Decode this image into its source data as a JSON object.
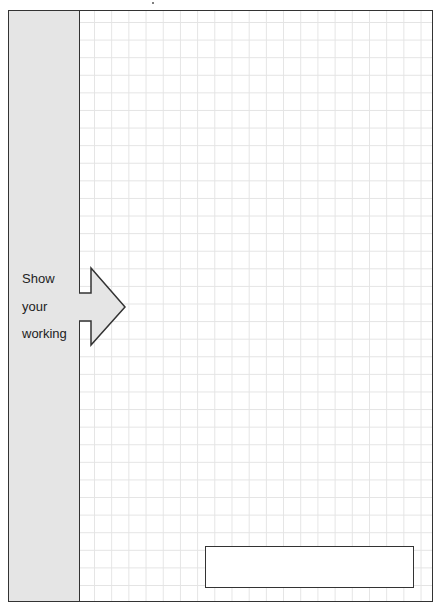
{
  "sidebar": {
    "label_lines": [
      "Show",
      "your",
      "working"
    ]
  },
  "colors": {
    "border": "#333333",
    "sidebar_fill": "#e5e5e5",
    "grid_line": "#e4e4e4",
    "arrow_fill": "#e5e5e5"
  },
  "answer_box": {
    "value": ""
  }
}
